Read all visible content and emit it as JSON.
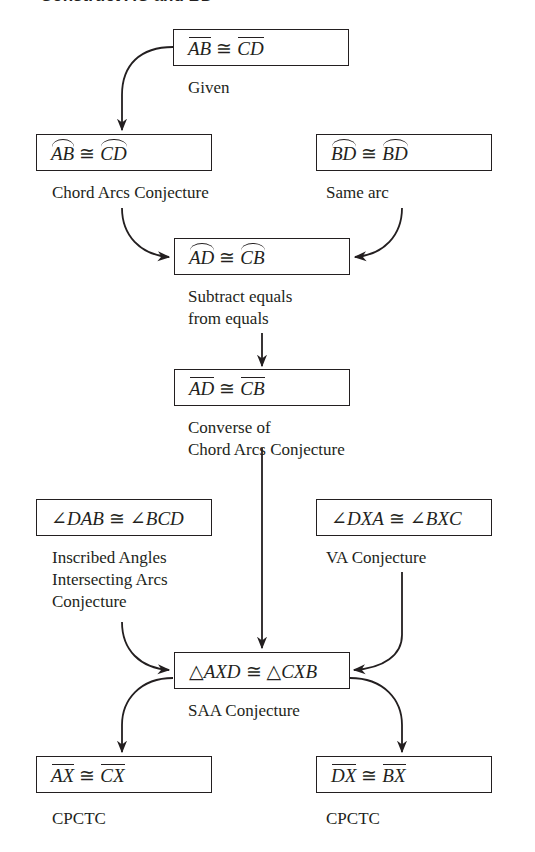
{
  "heading": "Construct AC and BD",
  "nodes": [
    {
      "id": "n1",
      "left": "AB",
      "right": "CD",
      "mark": "bar",
      "op": "≅",
      "reason": [
        "Given"
      ]
    },
    {
      "id": "n2",
      "left": "AB",
      "right": "CD",
      "mark": "arc",
      "op": "≅",
      "reason": [
        "Chord Arcs Conjecture"
      ]
    },
    {
      "id": "n3",
      "left": "BD",
      "right": "BD",
      "mark": "arc",
      "op": "≅",
      "reason": [
        "Same arc"
      ]
    },
    {
      "id": "n4",
      "left": "AD",
      "right": "CB",
      "mark": "arc",
      "op": "≅",
      "reason": [
        "Subtract equals",
        "from equals"
      ]
    },
    {
      "id": "n5",
      "left": "AD",
      "right": "CB",
      "mark": "bar",
      "op": "≅",
      "reason": [
        "Converse of",
        "Chord Arcs Conjecture"
      ]
    },
    {
      "id": "n6",
      "left": "DAB",
      "right": "BCD",
      "mark": "angle",
      "op": "≅",
      "reason": [
        "Inscribed Angles",
        "Intersecting Arcs",
        "Conjecture"
      ]
    },
    {
      "id": "n7",
      "left": "DXA",
      "right": "BXC",
      "mark": "angle",
      "op": "≅",
      "reason": [
        "VA Conjecture"
      ]
    },
    {
      "id": "n8",
      "left": "AXD",
      "right": "CXB",
      "mark": "triangle",
      "op": "≅",
      "reason": [
        "SAA Conjecture"
      ]
    },
    {
      "id": "n9",
      "left": "AX",
      "right": "CX",
      "mark": "bar",
      "op": "≅",
      "reason": [
        "CPCTC"
      ]
    },
    {
      "id": "n10",
      "left": "DX",
      "right": "BX",
      "mark": "bar",
      "op": "≅",
      "reason": [
        "CPCTC"
      ]
    }
  ],
  "symbols": {
    "angle": "∠",
    "triangle": "△"
  },
  "edges": [
    [
      "n1",
      "n2"
    ],
    [
      "n2",
      "n4"
    ],
    [
      "n3",
      "n4"
    ],
    [
      "n4",
      "n5"
    ],
    [
      "n5",
      "n8"
    ],
    [
      "n6",
      "n8"
    ],
    [
      "n7",
      "n8"
    ],
    [
      "n8",
      "n9"
    ],
    [
      "n8",
      "n10"
    ]
  ]
}
